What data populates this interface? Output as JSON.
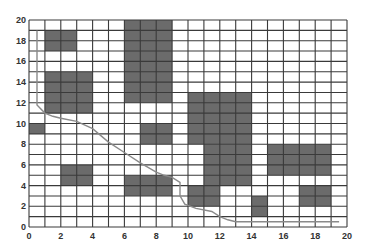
{
  "chart_data": {
    "type": "heatmap",
    "title": "",
    "xlabel": "",
    "ylabel": "",
    "xlim": [
      0,
      20
    ],
    "ylim": [
      0,
      20
    ],
    "grid": true,
    "grid_step": 1,
    "x_ticks": [
      0,
      2,
      4,
      6,
      8,
      10,
      12,
      14,
      16,
      18,
      20
    ],
    "y_ticks": [
      0,
      2,
      4,
      6,
      8,
      10,
      12,
      14,
      16,
      18,
      20
    ],
    "obstacles": [
      {
        "x0": 1,
        "x1": 3,
        "y0": 17,
        "y1": 19
      },
      {
        "x0": 1,
        "x1": 4,
        "y0": 11,
        "y1": 15
      },
      {
        "x0": 0,
        "x1": 1,
        "y0": 9,
        "y1": 10
      },
      {
        "x0": 2,
        "x1": 4,
        "y0": 4,
        "y1": 6
      },
      {
        "x0": 6,
        "x1": 9,
        "y0": 12,
        "y1": 20
      },
      {
        "x0": 7,
        "x1": 9,
        "y0": 8,
        "y1": 10
      },
      {
        "x0": 6,
        "x1": 9,
        "y0": 3,
        "y1": 5
      },
      {
        "x0": 10,
        "x1": 14,
        "y0": 8,
        "y1": 13
      },
      {
        "x0": 11,
        "x1": 14,
        "y0": 4,
        "y1": 8
      },
      {
        "x0": 10,
        "x1": 12,
        "y0": 2,
        "y1": 4
      },
      {
        "x0": 14,
        "x1": 15,
        "y0": 1,
        "y1": 3
      },
      {
        "x0": 15,
        "x1": 19,
        "y0": 5,
        "y1": 8
      },
      {
        "x0": 17,
        "x1": 19,
        "y0": 2,
        "y1": 4
      }
    ],
    "path": [
      [
        0.5,
        19
      ],
      [
        0.5,
        11.8
      ],
      [
        1,
        11
      ],
      [
        1.5,
        10.7
      ],
      [
        2,
        10.5
      ],
      [
        3,
        10.2
      ],
      [
        4,
        9.5
      ],
      [
        5,
        8.2
      ],
      [
        6,
        7.2
      ],
      [
        7,
        6.2
      ],
      [
        8,
        5.3
      ],
      [
        8.5,
        5
      ],
      [
        9,
        4.8
      ],
      [
        9.5,
        4.3
      ],
      [
        9.5,
        3
      ],
      [
        9.8,
        2.2
      ],
      [
        10.5,
        1.8
      ],
      [
        11.5,
        1.5
      ],
      [
        12,
        1
      ],
      [
        12.5,
        0.7
      ],
      [
        13,
        0.5
      ],
      [
        19.5,
        0.5
      ]
    ],
    "colors": {
      "obstacle": "#6b6b6b",
      "grid": "#3a3a3a",
      "path": "#8a8a8a",
      "background": "#ffffff"
    }
  }
}
